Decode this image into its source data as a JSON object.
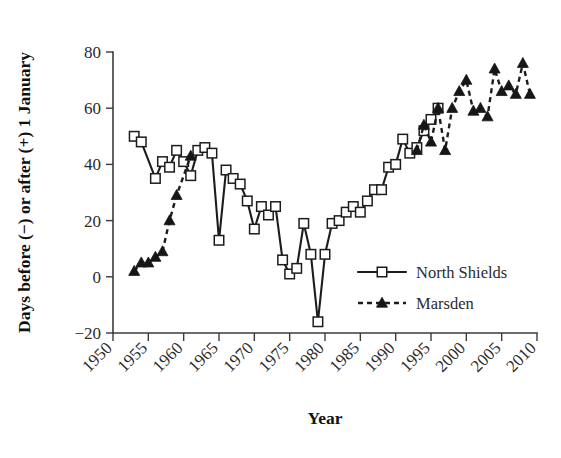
{
  "chart_data": {
    "type": "line",
    "title": "",
    "xlabel": "Year",
    "ylabel": "Days before (−) or after (+) 1 January",
    "xlim": [
      1950,
      2010
    ],
    "ylim": [
      -20,
      80
    ],
    "xticks": [
      1950,
      1955,
      1960,
      1965,
      1970,
      1975,
      1980,
      1985,
      1990,
      1995,
      2000,
      2005,
      2010
    ],
    "yticks": [
      -20,
      0,
      20,
      40,
      60,
      80
    ],
    "grid": false,
    "legend_position": "center-right",
    "series": [
      {
        "name": "North Shields",
        "marker": "open-square",
        "linestyle": "solid",
        "color": "#1c1c1c",
        "points": [
          [
            1953,
            50
          ],
          [
            1954,
            48
          ],
          [
            1956,
            35
          ],
          [
            1957,
            41
          ],
          [
            1958,
            39
          ],
          [
            1959,
            45
          ],
          [
            1960,
            41
          ],
          [
            1961,
            36
          ],
          [
            1962,
            45
          ],
          [
            1963,
            46
          ],
          [
            1964,
            44
          ],
          [
            1965,
            13
          ],
          [
            1966,
            38
          ],
          [
            1967,
            35
          ],
          [
            1968,
            33
          ],
          [
            1969,
            27
          ],
          [
            1970,
            17
          ],
          [
            1971,
            25
          ],
          [
            1972,
            22
          ],
          [
            1973,
            25
          ],
          [
            1974,
            6
          ],
          [
            1975,
            1
          ],
          [
            1976,
            3
          ],
          [
            1977,
            19
          ],
          [
            1978,
            8
          ],
          [
            1979,
            -16
          ],
          [
            1980,
            8
          ],
          [
            1981,
            19
          ],
          [
            1982,
            20
          ],
          [
            1983,
            23
          ],
          [
            1984,
            25
          ],
          [
            1985,
            23
          ],
          [
            1986,
            27
          ],
          [
            1987,
            31
          ],
          [
            1988,
            31
          ],
          [
            1989,
            39
          ],
          [
            1990,
            40
          ],
          [
            1991,
            49
          ],
          [
            1992,
            44
          ],
          [
            1993,
            46
          ],
          [
            1994,
            52
          ],
          [
            1995,
            56
          ],
          [
            1996,
            60
          ]
        ]
      },
      {
        "name": "Marsden",
        "marker": "filled-triangle",
        "linestyle": "dashed",
        "color": "#161616",
        "points": [
          [
            1953,
            2
          ],
          [
            1954,
            5
          ],
          [
            1955,
            5
          ],
          [
            1956,
            7
          ],
          [
            1957,
            9
          ],
          [
            1958,
            20
          ],
          [
            1959,
            29
          ],
          [
            1961,
            43
          ],
          [
            1993,
            45
          ],
          [
            1994,
            54
          ],
          [
            1995,
            48
          ],
          [
            1996,
            60
          ],
          [
            1997,
            45
          ],
          [
            1998,
            60
          ],
          [
            1999,
            66
          ],
          [
            2000,
            70
          ],
          [
            2001,
            59
          ],
          [
            2002,
            60
          ],
          [
            2003,
            57
          ],
          [
            2004,
            74
          ],
          [
            2005,
            66
          ],
          [
            2006,
            68
          ],
          [
            2007,
            65
          ],
          [
            2008,
            76
          ],
          [
            2009,
            65
          ]
        ]
      }
    ]
  },
  "legend": {
    "entries": [
      {
        "label": "North Shields",
        "marker": "open-square",
        "linestyle": "solid"
      },
      {
        "label": "Marsden",
        "marker": "filled-triangle",
        "linestyle": "dashed"
      }
    ]
  }
}
